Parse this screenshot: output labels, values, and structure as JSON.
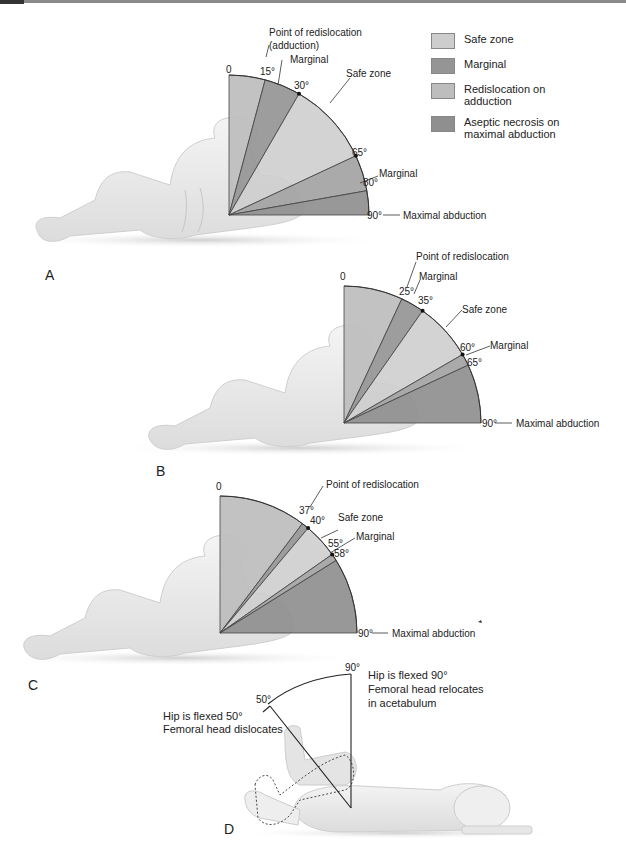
{
  "legend": {
    "items": [
      {
        "label": "Safe zone",
        "color": "#cdcdcd"
      },
      {
        "label": "Marginal",
        "color": "#959595"
      },
      {
        "label": "Redislocation on adduction",
        "color": "#bdbdbd"
      },
      {
        "label": "Aseptic necrosis on maximal abduction",
        "color": "#8f8f8f"
      }
    ]
  },
  "panels": {
    "A": {
      "label": "A",
      "zero_label": "0",
      "angles": {
        "a1": "15°",
        "a2": "30°",
        "a3": "65°",
        "a4": "80°",
        "a5": "90°"
      },
      "callouts": {
        "redislocation": "Point of redislocation",
        "redislocation_sub": "(adduction)",
        "marginal1": "Marginal",
        "safe": "Safe zone",
        "marginal2": "Marginal",
        "maximal": "Maximal abduction"
      },
      "zones": [
        {
          "from": 0,
          "to": 15,
          "type": "Redislocation on adduction"
        },
        {
          "from": 15,
          "to": 30,
          "type": "Marginal"
        },
        {
          "from": 30,
          "to": 65,
          "type": "Safe zone"
        },
        {
          "from": 65,
          "to": 80,
          "type": "Marginal"
        },
        {
          "from": 80,
          "to": 90,
          "type": "Aseptic necrosis on maximal abduction"
        }
      ]
    },
    "B": {
      "label": "B",
      "zero_label": "0",
      "angles": {
        "a1": "25°",
        "a2": "35°",
        "a3": "60°",
        "a4": "65°",
        "a5": "90°"
      },
      "callouts": {
        "redislocation": "Point of redislocation",
        "marginal1": "Marginal",
        "safe": "Safe zone",
        "marginal2": "Marginal",
        "maximal": "Maximal abduction"
      },
      "zones": [
        {
          "from": 0,
          "to": 25,
          "type": "Redislocation on adduction"
        },
        {
          "from": 25,
          "to": 35,
          "type": "Marginal"
        },
        {
          "from": 35,
          "to": 60,
          "type": "Safe zone"
        },
        {
          "from": 60,
          "to": 65,
          "type": "Marginal"
        },
        {
          "from": 65,
          "to": 90,
          "type": "Aseptic necrosis on maximal abduction"
        }
      ]
    },
    "C": {
      "label": "C",
      "zero_label": "0",
      "angles": {
        "a1": "37°",
        "a2": "40°",
        "a3": "55°",
        "a4": "58°",
        "a5": "90°"
      },
      "callouts": {
        "redislocation": "Point of redislocation",
        "safe": "Safe zone",
        "marginal": "Marginal",
        "maximal": "Maximal abduction"
      },
      "zones": [
        {
          "from": 0,
          "to": 37,
          "type": "Redislocation on adduction"
        },
        {
          "from": 37,
          "to": 40,
          "type": "Marginal"
        },
        {
          "from": 40,
          "to": 55,
          "type": "Safe zone"
        },
        {
          "from": 55,
          "to": 58,
          "type": "Marginal"
        },
        {
          "from": 58,
          "to": 90,
          "type": "Aseptic necrosis on maximal abduction"
        }
      ]
    },
    "D": {
      "label": "D",
      "angle_50": "50°",
      "angle_90": "90°",
      "left_text": [
        "Hip is flexed 50°",
        "Femoral head dislocates"
      ],
      "right_text": [
        "Hip is flexed 90°",
        "Femoral head relocates",
        "in acetabulum"
      ]
    }
  }
}
